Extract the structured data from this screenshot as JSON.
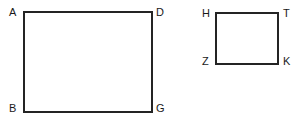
{
  "figure": {
    "width": 302,
    "height": 126,
    "background_color": "#ffffff",
    "stroke_color": "#242424",
    "label_color": "#1a1a1a",
    "stroke_width_px": 2,
    "label_font_size_px": 11
  },
  "shapes": [
    {
      "id": "rect-abgd",
      "type": "rectangle",
      "name": "large-rectangle",
      "vertex_order": [
        "A",
        "D",
        "G",
        "B"
      ],
      "x": 23,
      "y": 11,
      "width": 130,
      "height": 102
    },
    {
      "id": "rect-htkz",
      "type": "rectangle",
      "name": "small-rectangle",
      "vertex_order": [
        "H",
        "T",
        "K",
        "Z"
      ],
      "x": 215,
      "y": 12,
      "width": 64,
      "height": 53
    }
  ],
  "labels": {
    "large_rectangle": {
      "top_left": "A",
      "top_right": "D",
      "bottom_left": "B",
      "bottom_right": "G"
    },
    "small_rectangle": {
      "top_left": "H",
      "top_right": "T",
      "bottom_left": "Z",
      "bottom_right": "K"
    }
  },
  "chart_data": {
    "type": "diagram",
    "title": "",
    "figures": [
      {
        "name": "large-rectangle",
        "vertices": [
          {
            "label": "A",
            "position": "top-left",
            "x": 23,
            "y": 11
          },
          {
            "label": "D",
            "position": "top-right",
            "x": 153,
            "y": 11
          },
          {
            "label": "G",
            "position": "bottom-right",
            "x": 153,
            "y": 113
          },
          {
            "label": "B",
            "position": "bottom-left",
            "x": 23,
            "y": 113
          }
        ],
        "width": 130,
        "height": 102
      },
      {
        "name": "small-rectangle",
        "vertices": [
          {
            "label": "H",
            "position": "top-left",
            "x": 215,
            "y": 12
          },
          {
            "label": "T",
            "position": "top-right",
            "x": 279,
            "y": 12
          },
          {
            "label": "K",
            "position": "bottom-right",
            "x": 279,
            "y": 65
          },
          {
            "label": "Z",
            "position": "bottom-left",
            "x": 215,
            "y": 65
          }
        ],
        "width": 64,
        "height": 53
      }
    ]
  }
}
